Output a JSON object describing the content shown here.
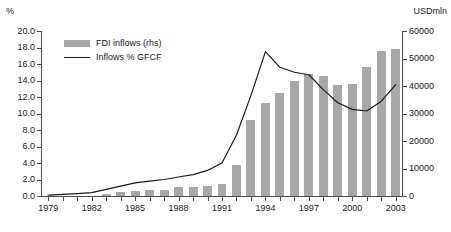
{
  "axes": {
    "left_unit": "%",
    "right_unit": "USDmln",
    "left_ticks": [
      "0.0",
      "2.0",
      "4.0",
      "6.0",
      "8.0",
      "10.0",
      "12.0",
      "14.0",
      "16.0",
      "18.0",
      "20.0"
    ],
    "right_ticks": [
      "0",
      "10000",
      "20000",
      "30000",
      "40000",
      "50000",
      "60000"
    ],
    "x_ticks": [
      "1979",
      "1982",
      "1985",
      "1988",
      "1991",
      "1994",
      "1997",
      "2000",
      "2003"
    ]
  },
  "legend": {
    "bar_label": "FDI inflows (rhs)",
    "line_label": "Inflows % GFCF",
    "bar_color": "#a8a8a8",
    "line_color": "#1a1a1a"
  },
  "chart_data": {
    "type": "bar",
    "title": "",
    "subtitle": "",
    "xlabel": "",
    "ylabel": "%",
    "y2label": "USDmln",
    "ylim": [
      0,
      20
    ],
    "y2lim": [
      0,
      60000
    ],
    "ytick_step": 2,
    "y2tick_step": 10000,
    "grid": false,
    "legend_position": "top-left",
    "categories": [
      "1979",
      "1980",
      "1981",
      "1982",
      "1983",
      "1984",
      "1985",
      "1986",
      "1987",
      "1988",
      "1989",
      "1990",
      "1991",
      "1992",
      "1993",
      "1994",
      "1995",
      "1996",
      "1997",
      "1998",
      "1999",
      "2000",
      "2001",
      "2002",
      "2003"
    ],
    "series": [
      {
        "name": "FDI inflows (rhs)",
        "type": "bar",
        "axis": "right",
        "unit": "USDmln",
        "color": "#a8a8a8",
        "values": [
          0,
          0,
          0,
          0,
          900,
          1400,
          2000,
          2200,
          2300,
          3200,
          3400,
          3500,
          4400,
          11200,
          27500,
          33800,
          37500,
          41700,
          44200,
          43800,
          40300,
          40700,
          46900,
          52700,
          53500
        ]
      },
      {
        "name": "Inflows % GFCF",
        "type": "line",
        "axis": "left",
        "unit": "%",
        "color": "#1a1a1a",
        "values": [
          0.1,
          0.2,
          0.3,
          0.4,
          0.8,
          1.2,
          1.6,
          1.8,
          2.0,
          2.3,
          2.6,
          3.1,
          4.0,
          7.4,
          12.2,
          17.5,
          15.6,
          15.0,
          14.7,
          12.9,
          11.3,
          10.5,
          10.3,
          11.5,
          13.5
        ]
      }
    ]
  }
}
